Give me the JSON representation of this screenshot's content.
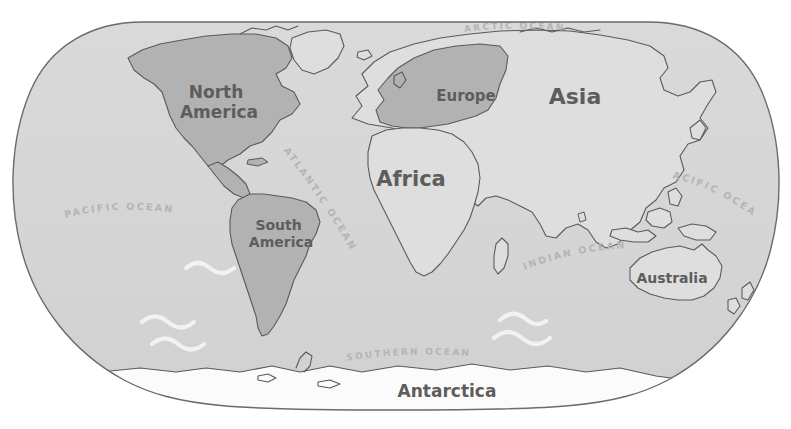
{
  "map": {
    "projection_name": "winkel-tripel",
    "title": "World Map",
    "colors": {
      "background": "#ffffff",
      "ocean": "#d6d6d6",
      "ocean_edge": "#6b6b6b",
      "land_light": "#dedede",
      "land_dark": "#b2b2b2",
      "antarctica": "#fbfbfb",
      "coastline": "#5a5a5a",
      "continent_label": "#5d5d5d",
      "ocean_label": "#b4b4b4",
      "wave": "#f2f2f2"
    },
    "continents": [
      {
        "id": "north-america",
        "label": "North America",
        "lines": [
          "North",
          "America"
        ],
        "x": 219,
        "y": 102,
        "font_size": 17,
        "shade": "dark"
      },
      {
        "id": "south-america",
        "label": "South America",
        "lines": [
          "South",
          "America"
        ],
        "x": 281,
        "y": 234,
        "font_size": 14,
        "shade": "dark"
      },
      {
        "id": "europe",
        "label": "Europe",
        "lines": [
          "Europe"
        ],
        "x": 466,
        "y": 96,
        "font_size": 15,
        "shade": "dark"
      },
      {
        "id": "africa",
        "label": "Africa",
        "lines": [
          "Africa"
        ],
        "x": 411,
        "y": 180,
        "font_size": 21,
        "shade": "light"
      },
      {
        "id": "asia",
        "label": "Asia",
        "lines": [
          "Asia"
        ],
        "x": 575,
        "y": 98,
        "font_size": 22,
        "shade": "light"
      },
      {
        "id": "australia",
        "label": "Australia",
        "lines": [
          "Australia"
        ],
        "x": 672,
        "y": 279,
        "font_size": 14,
        "shade": "light"
      },
      {
        "id": "antarctica",
        "label": "Antarctica",
        "lines": [
          "Antarctica"
        ],
        "x": 447,
        "y": 392,
        "font_size": 17,
        "shade": "white"
      }
    ],
    "oceans": [
      {
        "id": "arctic-ocean",
        "label": "ARCTIC     OCEAN",
        "x": 512,
        "y": 30,
        "font_size": 9,
        "rotate": 0
      },
      {
        "id": "pacific-ocean-west",
        "label": "PACIFIC OCEAN",
        "x": 116,
        "y": 221,
        "font_size": 9.5,
        "rotate": -12
      },
      {
        "id": "atlantic-ocean",
        "label": "ATLANTIC OCEAN",
        "x": 322,
        "y": 200,
        "font_size": 9.5,
        "rotate": 64
      },
      {
        "id": "indian-ocean",
        "label": "INDIAN OCEAN",
        "x": 573,
        "y": 261,
        "font_size": 9.5,
        "rotate": -13
      },
      {
        "id": "pacific-ocean-east",
        "label": "PACIFIC OCEAN",
        "x": 712,
        "y": 192,
        "font_size": 9.5,
        "rotate": 22
      },
      {
        "id": "southern-ocean",
        "label": "SOUTHERN OCEAN",
        "x": 407,
        "y": 358,
        "font_size": 9,
        "rotate": -3
      }
    ],
    "waves": [
      {
        "id": "wave-pacific-1",
        "x": 190,
        "y": 268
      },
      {
        "id": "wave-pacific-2",
        "x": 148,
        "y": 323
      },
      {
        "id": "wave-pacific-3",
        "x": 158,
        "y": 344
      },
      {
        "id": "wave-indian-1",
        "x": 503,
        "y": 315
      },
      {
        "id": "wave-indian-2",
        "x": 512,
        "y": 334
      }
    ]
  }
}
